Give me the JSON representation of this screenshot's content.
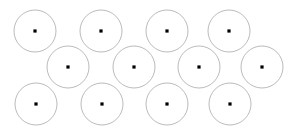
{
  "diagram": {
    "type": "circle-packing-lattice",
    "canvas": {
      "width": 296,
      "height": 134,
      "background_color": "#ffffff"
    },
    "style": {
      "circle_stroke_color": "#a9a9a9",
      "circle_stroke_width": 0.8,
      "circle_fill": "none",
      "center_dot_color": "#000000",
      "center_dot_size": 3.2,
      "circle_radius": 21
    },
    "rows": [
      {
        "name": "top-row",
        "index": 0,
        "center_y": 31,
        "count": 4,
        "centers_x": [
          35,
          101,
          167,
          229
        ]
      },
      {
        "name": "middle-row",
        "index": 1,
        "center_y": 67,
        "count": 4,
        "centers_x": [
          68,
          134,
          199,
          262
        ]
      },
      {
        "name": "bottom-row",
        "index": 2,
        "center_y": 104,
        "count": 4,
        "centers_x": [
          36,
          102,
          167,
          230
        ]
      }
    ],
    "circles": [
      {
        "id": "circle-1",
        "row": 0,
        "col": 0,
        "cx": 35,
        "cy": 31,
        "r": 21
      },
      {
        "id": "circle-2",
        "row": 0,
        "col": 1,
        "cx": 101,
        "cy": 31,
        "r": 21
      },
      {
        "id": "circle-3",
        "row": 0,
        "col": 2,
        "cx": 167,
        "cy": 31,
        "r": 21
      },
      {
        "id": "circle-4",
        "row": 0,
        "col": 3,
        "cx": 229,
        "cy": 31,
        "r": 21
      },
      {
        "id": "circle-5",
        "row": 1,
        "col": 0,
        "cx": 68,
        "cy": 67,
        "r": 21
      },
      {
        "id": "circle-6",
        "row": 1,
        "col": 1,
        "cx": 134,
        "cy": 67,
        "r": 21
      },
      {
        "id": "circle-7",
        "row": 1,
        "col": 2,
        "cx": 199,
        "cy": 67,
        "r": 21
      },
      {
        "id": "circle-8",
        "row": 1,
        "col": 3,
        "cx": 262,
        "cy": 67,
        "r": 21
      },
      {
        "id": "circle-9",
        "row": 2,
        "col": 0,
        "cx": 36,
        "cy": 104,
        "r": 21
      },
      {
        "id": "circle-10",
        "row": 2,
        "col": 1,
        "cx": 102,
        "cy": 104,
        "r": 21
      },
      {
        "id": "circle-11",
        "row": 2,
        "col": 2,
        "cx": 167,
        "cy": 104,
        "r": 21
      },
      {
        "id": "circle-12",
        "row": 2,
        "col": 3,
        "cx": 230,
        "cy": 104,
        "r": 21
      }
    ],
    "total_circles": 12
  }
}
